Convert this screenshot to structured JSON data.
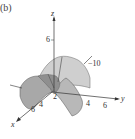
{
  "figure": {
    "panel_label": "(b)",
    "axes": {
      "x_label": "x",
      "y_label": "y",
      "z_label": "z"
    },
    "ticks": {
      "z": "6",
      "x": [
        "2",
        "4",
        "6"
      ],
      "y": [
        "4",
        "6"
      ],
      "annotation": "−10"
    },
    "surface": {
      "type": "saddle (hyperbolic paraboloid)",
      "fill_light": "#c8c8c8",
      "fill_dark": "#9a9a9a",
      "stroke": "#555555"
    }
  }
}
